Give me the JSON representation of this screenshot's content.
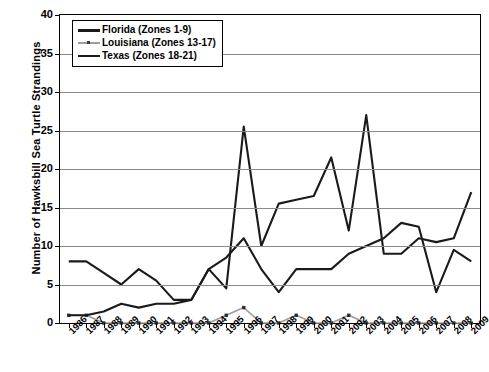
{
  "chart_data": {
    "type": "line",
    "title": "",
    "xlabel": "",
    "ylabel": "Number of Hawksbill Sea Turtle Strandings",
    "ylim": [
      0,
      40
    ],
    "ytick_step": 5,
    "yticks": [
      0,
      5,
      10,
      15,
      20,
      25,
      30,
      35,
      40
    ],
    "grid": true,
    "legend_position": "top-left",
    "categories": [
      "1986",
      "1987",
      "1988",
      "1989",
      "1990",
      "1991",
      "1992",
      "1993",
      "1994",
      "1995",
      "1996",
      "1997",
      "1998",
      "1999",
      "2000",
      "2001",
      "2002",
      "2003",
      "2004",
      "2005",
      "2006",
      "2007",
      "2008",
      "2009"
    ],
    "series": [
      {
        "name": "Florida (Zones 1-9)",
        "color": "#1a1a1a",
        "style": "solid",
        "values": [
          8,
          8,
          6.5,
          5,
          7,
          5.5,
          3,
          3,
          7,
          8.5,
          11,
          7,
          4,
          7,
          7,
          7,
          9,
          10,
          11,
          13,
          12.5,
          4,
          9.5,
          8
        ]
      },
      {
        "name": "Louisiana (Zones 13-17)",
        "color": "#9d9d9d",
        "style": "dashed-marker",
        "values": [
          1,
          1,
          0,
          0,
          0,
          0,
          0,
          0,
          0,
          1,
          2,
          0,
          0,
          1,
          0,
          0,
          1,
          0,
          0,
          0,
          0,
          0,
          0,
          0
        ]
      },
      {
        "name": "Texas (Zones 18-21)",
        "color": "#1a1a1a",
        "style": "solid",
        "values": [
          1,
          1,
          1.5,
          2.5,
          2,
          2.5,
          2.5,
          3,
          7,
          4.5,
          25.5,
          10,
          15.5,
          16,
          16.5,
          21.5,
          12,
          27,
          9,
          9,
          11,
          10.5,
          11,
          17
        ]
      }
    ]
  },
  "legend": {
    "items": [
      {
        "label": "Florida (Zones 1-9)"
      },
      {
        "label": "Louisiana (Zones 13-17)"
      },
      {
        "label": "Texas (Zones 18-21)"
      }
    ]
  }
}
